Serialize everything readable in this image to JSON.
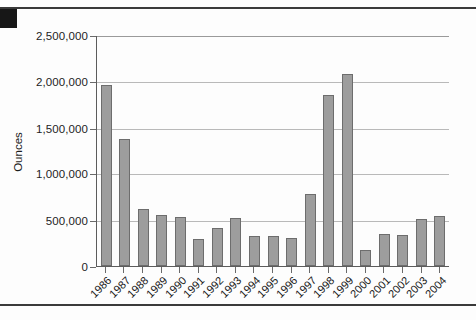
{
  "document": {
    "corner_mark": "page-edge-mark"
  },
  "chart_data": {
    "type": "bar",
    "title": "",
    "xlabel": "",
    "ylabel": "Ounces",
    "ylim": [
      0,
      2500000
    ],
    "ytick_labels": [
      "2,500,000",
      "2,000,000",
      "1,500,000",
      "1,000,000",
      "500,000",
      "0"
    ],
    "ytick_values": [
      2500000,
      2000000,
      1500000,
      1000000,
      500000,
      0
    ],
    "grid": true,
    "legend": "none",
    "bar_color": "#9d9d9d",
    "bar_edge_color": "#6d6d6d",
    "categories": [
      "1986",
      "1987",
      "1988",
      "1989",
      "1990",
      "1991",
      "1992",
      "1993",
      "1994",
      "1995",
      "1996",
      "1997",
      "1998",
      "1999",
      "2000",
      "2001",
      "2002",
      "2003",
      "2004"
    ],
    "values": [
      1960000,
      1380000,
      612000,
      555000,
      530000,
      295000,
      410000,
      525000,
      330000,
      320000,
      300000,
      780000,
      1855000,
      2075000,
      175000,
      345000,
      340000,
      510000,
      545000
    ]
  }
}
